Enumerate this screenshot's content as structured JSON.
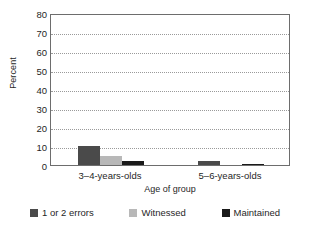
{
  "chart_data": {
    "type": "bar",
    "title": "",
    "xlabel": "Age of group",
    "ylabel": "Percent",
    "categories": [
      "3–4-years-olds",
      "5–6-years-olds"
    ],
    "series": [
      {
        "name": "1 or 2 errors",
        "values": [
          10,
          2
        ],
        "color": "#4a4a4a"
      },
      {
        "name": "Witnessed",
        "values": [
          5,
          0
        ],
        "color": "#b8b8b8"
      },
      {
        "name": "Maintained",
        "values": [
          2,
          0.7
        ],
        "color": "#1a1a1a"
      }
    ],
    "ylim": [
      0,
      80
    ],
    "yticks": [
      0,
      10,
      20,
      30,
      40,
      50,
      60,
      70,
      80
    ],
    "ytick_labels": [
      "0",
      "10",
      "20",
      "30",
      "40",
      "50",
      "60",
      "70",
      "80"
    ],
    "grid": "horizontal-dotted",
    "legend_position": "bottom"
  },
  "axes": {
    "y_title": "Percent",
    "x_title": "Age of group"
  },
  "legend": {
    "items": [
      {
        "label": "1 or 2 errors",
        "color": "#4a4a4a"
      },
      {
        "label": "Witnessed",
        "color": "#b8b8b8"
      },
      {
        "label": "Maintained",
        "color": "#1a1a1a"
      }
    ]
  }
}
